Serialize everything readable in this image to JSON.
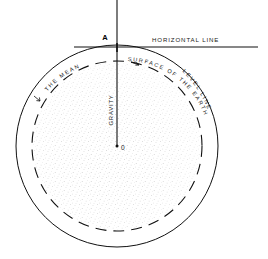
{
  "figure": {
    "labels": {
      "point_a": "A",
      "horizontal_line": "HORIZONTAL  LINE",
      "mean_surface_part1": "THE  MEAN",
      "mean_surface_part2": "SURFACE  OF  THE  EARTH",
      "level_line": "LEVEL  LINE",
      "gravity": "GRAVITY",
      "center_point": "0"
    },
    "colors": {
      "ink": "#111111",
      "stipple": "#9a9a9a",
      "background": "#ffffff"
    },
    "geometry": {
      "center_x": 117,
      "center_y": 146,
      "outer_circle_radius": 101,
      "dashed_circle_radius": 85,
      "horizontal_line_y": 47,
      "horizontal_line_x_start": 74,
      "horizontal_line_x_end": 258,
      "vertical_line_x": 117,
      "vertical_line_y_start": 0,
      "vertical_line_y_end": 146
    }
  }
}
